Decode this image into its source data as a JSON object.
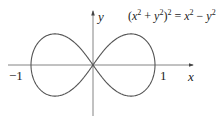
{
  "figure": {
    "equation": {
      "lhs_base": "(x",
      "lhs_mid": " + y",
      "lhs_close": ")",
      "exp": "2",
      "eq": " = x",
      "minus": " − y"
    },
    "equation_text": "(x^2 + y^2)^2 = x^2 - y^2",
    "axis_labels": {
      "x": "x",
      "y": "y"
    },
    "ticks": {
      "neg_one": "−1",
      "one": "1"
    },
    "colors": {
      "curve": "#555555",
      "axis": "#777777",
      "text": "#222222"
    }
  },
  "chart_data": {
    "type": "line",
    "curve": "lemniscate of Bernoulli",
    "xlabel": "x",
    "ylabel": "y",
    "tick_labels": [
      "-1",
      "1"
    ],
    "xlim": [
      -1,
      1
    ],
    "key_points": [
      [
        -1,
        0
      ],
      [
        0,
        0
      ],
      [
        1,
        0
      ],
      [
        0.612,
        0.354
      ],
      [
        -0.612,
        0.354
      ],
      [
        0.612,
        -0.354
      ],
      [
        -0.612,
        -0.354
      ]
    ],
    "grid": false
  }
}
